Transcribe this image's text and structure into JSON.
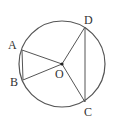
{
  "diagram": {
    "type": "circle-geometry",
    "circle": {
      "center": "O",
      "cx": 62,
      "cy": 64,
      "r": 43
    },
    "points": [
      {
        "name": "A",
        "x": 22,
        "y": 50,
        "label_x": 8,
        "label_y": 49
      },
      {
        "name": "B",
        "x": 23,
        "y": 80,
        "label_x": 10,
        "label_y": 86
      },
      {
        "name": "C",
        "x": 85,
        "y": 102,
        "label_x": 84,
        "label_y": 116
      },
      {
        "name": "D",
        "x": 85,
        "y": 27,
        "label_x": 84,
        "label_y": 24
      },
      {
        "name": "O",
        "x": 62,
        "y": 64,
        "label_x": 55,
        "label_y": 78
      }
    ],
    "segments": [
      "AB",
      "OA",
      "OB",
      "OC",
      "OD",
      "DC"
    ],
    "colors": {
      "stroke": "#555555",
      "text": "#333333"
    }
  }
}
